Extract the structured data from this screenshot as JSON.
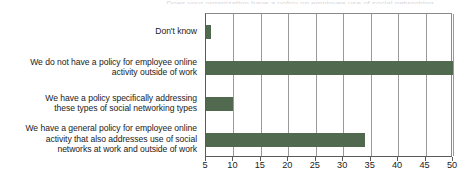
{
  "title_sliver": "Does your organization have a policy on employee use of social networking",
  "chart_data": {
    "type": "bar",
    "orientation": "horizontal",
    "title": "",
    "subtitle": "",
    "xlabel": "",
    "ylabel": "",
    "xlim": [
      5,
      50
    ],
    "ylim": null,
    "grid": true,
    "legend": false,
    "legend_position": "none",
    "bar_color": "#50694f",
    "categories": [
      "Don't know",
      "We do not have a policy for employee online activity outside of work",
      "We have a policy specifically addressing these types of social networking types",
      "We have a general policy for employee online activity that also addresses use of social networks at work and outside of work"
    ],
    "values": [
      6,
      50,
      10,
      34
    ],
    "xticks": [
      5,
      10,
      15,
      20,
      25,
      30,
      35,
      40,
      45,
      50
    ],
    "xticklabels": [
      "5",
      "10",
      "15",
      "20",
      "25",
      "30",
      "35",
      "40",
      "45",
      "50"
    ]
  },
  "categories_display": [
    {
      "lines": [
        "Don't know"
      ]
    },
    {
      "lines": [
        "We do not have a policy for employee online",
        "activity outside of work"
      ]
    },
    {
      "lines": [
        "We have a policy specifically addressing",
        "these types of social networking types"
      ]
    },
    {
      "lines": [
        "We have a general policy for employee online",
        "activity that also addresses use of social",
        "networks at work and outside of work"
      ]
    }
  ]
}
